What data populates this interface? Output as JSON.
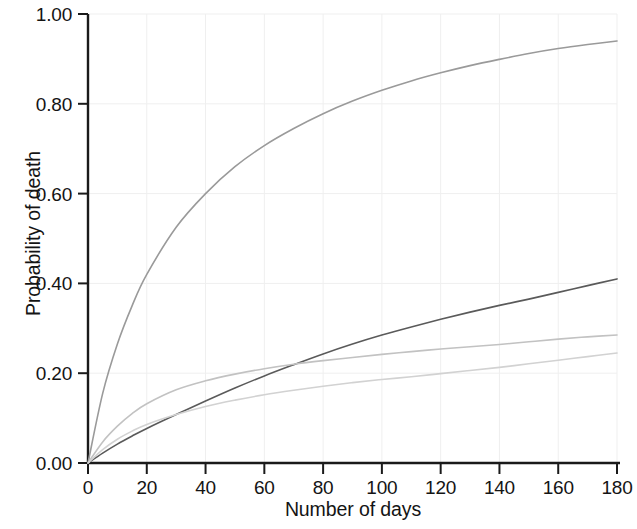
{
  "figure": {
    "background_color": "#ffffff",
    "axis_color": "#1a1a1a",
    "gridline_color": "#efefef"
  },
  "axes": {
    "x_title": "Number of days",
    "y_title": "Probability of death",
    "x_ticks": [
      "0",
      "20",
      "40",
      "60",
      "80",
      "100",
      "120",
      "140",
      "160",
      "180"
    ],
    "y_ticks": [
      "0.00",
      "0.20",
      "0.40",
      "0.60",
      "0.80",
      "1.00"
    ]
  },
  "chart_data": {
    "type": "line",
    "title": "",
    "xlabel": "Number of days",
    "ylabel": "Probability of death",
    "xlim": [
      0,
      180
    ],
    "ylim": [
      0.0,
      1.0
    ],
    "xticks": [
      0,
      20,
      40,
      60,
      80,
      100,
      120,
      140,
      160,
      180
    ],
    "yticks": [
      0.0,
      0.2,
      0.4,
      0.6,
      0.8,
      1.0
    ],
    "grid": true,
    "legend": "none",
    "x": [
      0,
      5,
      10,
      15,
      20,
      30,
      40,
      50,
      60,
      70,
      80,
      90,
      100,
      110,
      120,
      130,
      140,
      150,
      160,
      170,
      180
    ],
    "series": [
      {
        "name": "curve-1-highest",
        "color": "#9a9a9a",
        "values": [
          0.0,
          0.155,
          0.265,
          0.35,
          0.42,
          0.525,
          0.6,
          0.66,
          0.707,
          0.745,
          0.778,
          0.806,
          0.83,
          0.851,
          0.869,
          0.885,
          0.899,
          0.912,
          0.923,
          0.932,
          0.94
        ]
      },
      {
        "name": "curve-2-dark",
        "color": "#5a5a5a",
        "values": [
          0.0,
          0.022,
          0.042,
          0.06,
          0.077,
          0.108,
          0.138,
          0.167,
          0.194,
          0.219,
          0.243,
          0.265,
          0.285,
          0.303,
          0.32,
          0.336,
          0.351,
          0.365,
          0.38,
          0.395,
          0.41
        ]
      },
      {
        "name": "curve-3-middle",
        "color": "#c2c2c2",
        "values": [
          0.0,
          0.047,
          0.082,
          0.11,
          0.132,
          0.163,
          0.183,
          0.198,
          0.21,
          0.22,
          0.228,
          0.235,
          0.242,
          0.248,
          0.254,
          0.259,
          0.264,
          0.27,
          0.276,
          0.281,
          0.285
        ]
      },
      {
        "name": "curve-4-lowest",
        "color": "#d2d2d2",
        "values": [
          0.0,
          0.03,
          0.053,
          0.071,
          0.086,
          0.108,
          0.126,
          0.14,
          0.152,
          0.162,
          0.171,
          0.179,
          0.186,
          0.192,
          0.199,
          0.206,
          0.213,
          0.221,
          0.229,
          0.237,
          0.245
        ]
      }
    ]
  }
}
